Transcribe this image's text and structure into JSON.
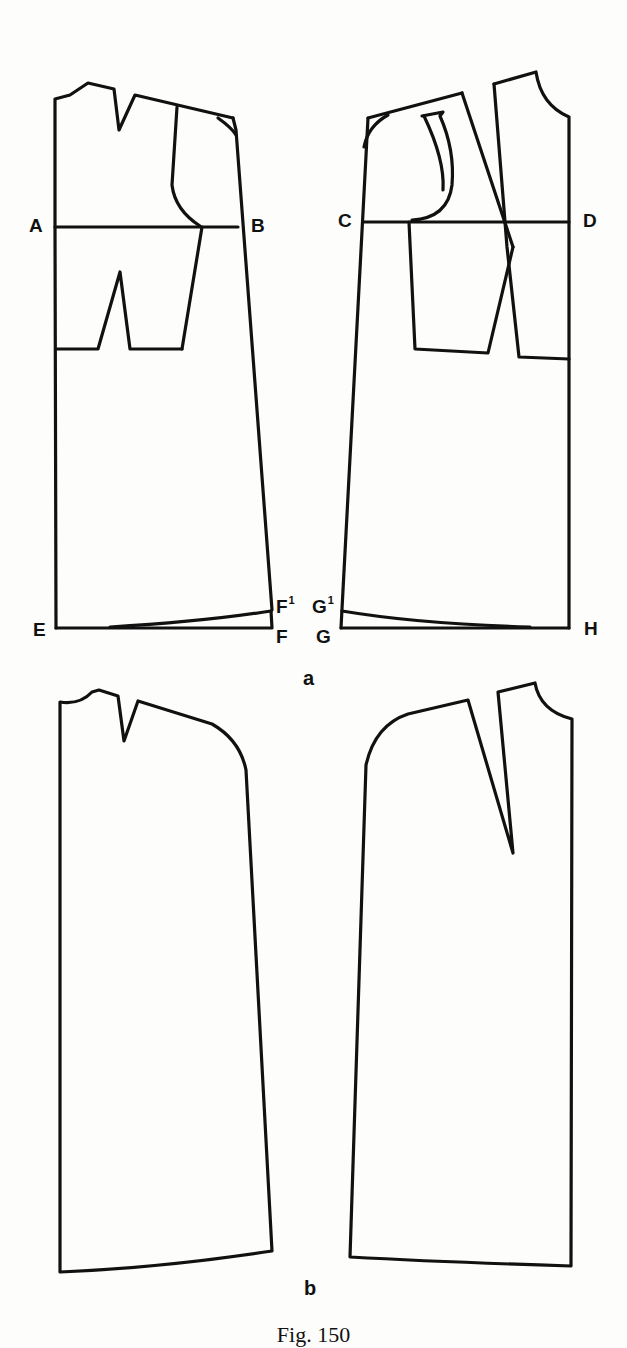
{
  "figure": {
    "caption": "Fig. 150",
    "parts": [
      {
        "id": "a",
        "label": "a"
      },
      {
        "id": "b",
        "label": "b"
      }
    ]
  },
  "points": {
    "A": "A",
    "B": "B",
    "C": "C",
    "D": "D",
    "E": "E",
    "F": "F",
    "F1_base": "F",
    "F1_sup": "1",
    "G": "G",
    "G1_base": "G",
    "G1_sup": "1",
    "H": "H"
  },
  "colors": {
    "line": "#111111",
    "background": "#fdfdfb"
  }
}
